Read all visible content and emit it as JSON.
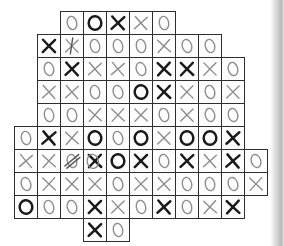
{
  "page": {
    "background": "#ffffff",
    "scan_edge_color": "#969696"
  },
  "board": {
    "type": "hand-drawn-xo-grid",
    "cell_size": 23,
    "origin_x": 14,
    "origin_y": 11,
    "grid_line_color": "#2e2e2e",
    "bold_ink_color": "#1a1a1a",
    "light_ink_color": "#8d8d8d",
    "scribble_color": "#555555",
    "rows": [
      {
        "row": 1,
        "cells": [
          {
            "col": 3,
            "sym": "O",
            "w": "light"
          },
          {
            "col": 4,
            "sym": "O",
            "w": "bold"
          },
          {
            "col": 5,
            "sym": "X",
            "w": "bold"
          },
          {
            "col": 6,
            "sym": "X",
            "w": "light"
          },
          {
            "col": 7,
            "sym": "O",
            "w": "light"
          }
        ]
      },
      {
        "row": 2,
        "cells": [
          {
            "col": 2,
            "sym": "X",
            "w": "bold"
          },
          {
            "col": 3,
            "sym": "X",
            "w": "light",
            "ov": "vstroke"
          },
          {
            "col": 4,
            "sym": "O",
            "w": "light"
          },
          {
            "col": 5,
            "sym": "O",
            "w": "light"
          },
          {
            "col": 6,
            "sym": "O",
            "w": "light"
          },
          {
            "col": 7,
            "sym": "X",
            "w": "light"
          },
          {
            "col": 8,
            "sym": "O",
            "w": "light"
          },
          {
            "col": 9,
            "sym": "O",
            "w": "light"
          }
        ]
      },
      {
        "row": 3,
        "cells": [
          {
            "col": 2,
            "sym": "O",
            "w": "light"
          },
          {
            "col": 3,
            "sym": "X",
            "w": "bold"
          },
          {
            "col": 4,
            "sym": "X",
            "w": "light"
          },
          {
            "col": 5,
            "sym": "X",
            "w": "light"
          },
          {
            "col": 6,
            "sym": "O",
            "w": "light"
          },
          {
            "col": 7,
            "sym": "X",
            "w": "bold"
          },
          {
            "col": 8,
            "sym": "X",
            "w": "bold"
          },
          {
            "col": 9,
            "sym": "X",
            "w": "light"
          },
          {
            "col": 10,
            "sym": "O",
            "w": "light"
          }
        ]
      },
      {
        "row": 4,
        "cells": [
          {
            "col": 2,
            "sym": "X",
            "w": "light"
          },
          {
            "col": 3,
            "sym": "X",
            "w": "light"
          },
          {
            "col": 4,
            "sym": "O",
            "w": "light"
          },
          {
            "col": 5,
            "sym": "O",
            "w": "light"
          },
          {
            "col": 6,
            "sym": "O",
            "w": "bold"
          },
          {
            "col": 7,
            "sym": "X",
            "w": "bold"
          },
          {
            "col": 8,
            "sym": "X",
            "w": "light"
          },
          {
            "col": 9,
            "sym": "O",
            "w": "light"
          },
          {
            "col": 10,
            "sym": "X",
            "w": "light"
          }
        ]
      },
      {
        "row": 5,
        "cells": [
          {
            "col": 2,
            "sym": "O",
            "w": "light"
          },
          {
            "col": 3,
            "sym": "O",
            "w": "light"
          },
          {
            "col": 4,
            "sym": "X",
            "w": "light"
          },
          {
            "col": 5,
            "sym": "X",
            "w": "light"
          },
          {
            "col": 6,
            "sym": "X",
            "w": "light"
          },
          {
            "col": 7,
            "sym": "O",
            "w": "light"
          },
          {
            "col": 8,
            "sym": "X",
            "w": "light"
          },
          {
            "col": 9,
            "sym": "O",
            "w": "light"
          },
          {
            "col": 10,
            "sym": "O",
            "w": "light"
          }
        ]
      },
      {
        "row": 6,
        "cells": [
          {
            "col": 1,
            "sym": "O",
            "w": "light"
          },
          {
            "col": 2,
            "sym": "X",
            "w": "bold"
          },
          {
            "col": 3,
            "sym": "X",
            "w": "light"
          },
          {
            "col": 4,
            "sym": "O",
            "w": "bold"
          },
          {
            "col": 5,
            "sym": "O",
            "w": "light"
          },
          {
            "col": 6,
            "sym": "O",
            "w": "bold"
          },
          {
            "col": 7,
            "sym": "X",
            "w": "light"
          },
          {
            "col": 8,
            "sym": "O",
            "w": "bold"
          },
          {
            "col": 9,
            "sym": "O",
            "w": "bold"
          },
          {
            "col": 10,
            "sym": "X",
            "w": "bold"
          }
        ]
      },
      {
        "row": 7,
        "cells": [
          {
            "col": 1,
            "sym": "X",
            "w": "light"
          },
          {
            "col": 2,
            "sym": "X",
            "w": "light"
          },
          {
            "col": 3,
            "sym": "O",
            "w": "light",
            "ov": "xscrib"
          },
          {
            "col": 4,
            "sym": "X",
            "w": "bold",
            "ov": "ring"
          },
          {
            "col": 5,
            "sym": "O",
            "w": "bold"
          },
          {
            "col": 6,
            "sym": "X",
            "w": "bold"
          },
          {
            "col": 7,
            "sym": "O",
            "w": "light"
          },
          {
            "col": 8,
            "sym": "X",
            "w": "bold"
          },
          {
            "col": 9,
            "sym": "X",
            "w": "light"
          },
          {
            "col": 10,
            "sym": "X",
            "w": "bold"
          },
          {
            "col": 11,
            "sym": "O",
            "w": "light"
          }
        ]
      },
      {
        "row": 8,
        "cells": [
          {
            "col": 1,
            "sym": "O",
            "w": "light"
          },
          {
            "col": 2,
            "sym": "X",
            "w": "light"
          },
          {
            "col": 3,
            "sym": "X",
            "w": "light"
          },
          {
            "col": 4,
            "sym": "X",
            "w": "light"
          },
          {
            "col": 5,
            "sym": "O",
            "w": "light"
          },
          {
            "col": 6,
            "sym": "X",
            "w": "light"
          },
          {
            "col": 7,
            "sym": "X",
            "w": "light"
          },
          {
            "col": 8,
            "sym": "O",
            "w": "light"
          },
          {
            "col": 9,
            "sym": "O",
            "w": "light"
          },
          {
            "col": 10,
            "sym": "O",
            "w": "light"
          },
          {
            "col": 11,
            "sym": "X",
            "w": "light"
          }
        ]
      },
      {
        "row": 9,
        "cells": [
          {
            "col": 1,
            "sym": "O",
            "w": "bold"
          },
          {
            "col": 2,
            "sym": "O",
            "w": "light"
          },
          {
            "col": 3,
            "sym": "O",
            "w": "light"
          },
          {
            "col": 4,
            "sym": "X",
            "w": "bold"
          },
          {
            "col": 5,
            "sym": "X",
            "w": "light"
          },
          {
            "col": 6,
            "sym": "O",
            "w": "light"
          },
          {
            "col": 7,
            "sym": "X",
            "w": "bold"
          },
          {
            "col": 8,
            "sym": "O",
            "w": "light"
          },
          {
            "col": 9,
            "sym": "X",
            "w": "light"
          },
          {
            "col": 10,
            "sym": "X",
            "w": "bold"
          }
        ]
      },
      {
        "row": 10,
        "cells": [
          {
            "col": 4,
            "sym": "X",
            "w": "bold"
          },
          {
            "col": 5,
            "sym": "O",
            "w": "light"
          }
        ]
      }
    ]
  }
}
